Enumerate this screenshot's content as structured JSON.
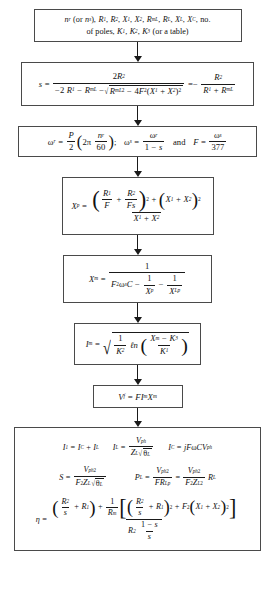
{
  "diagram": {
    "type": "flowchart",
    "orientation": "top-to-bottom",
    "node_count": 8,
    "connector": "down-arrow",
    "border_color": "#4a4a4a",
    "background_color": "#ffffff",
    "text_color": "#111111"
  },
  "nodes": [
    {
      "id": "inputs",
      "name": "input-parameters",
      "line1": "n_r (or n_s), R_1, R_2, X_1, X_2, R_mL, R_L, X_L, X_C, no.",
      "line2": "of poles, K_1, K_2, K_3 (or a table)",
      "symbols": {
        "n": "n",
        "nr_sub": "r",
        "or": "(or",
        "ns_sub": "s",
        "close": "),",
        "R": "R",
        "X": "X",
        "K": "K",
        "s1": "1",
        "s2": "2",
        "smL": "mL",
        "sL": "L",
        "sC": "C",
        "s3": "3",
        "no": "no.",
        "poles": "of poles,",
        "table": "(or a table)"
      }
    },
    {
      "id": "slip",
      "name": "slip-equation",
      "lhs": "s",
      "eq": "=",
      "numerator": "2R_2",
      "denominator": "-2R_1 - R_mL - sqrt(R_mL^2 - 4F^2(X_1+X_2)^2)",
      "rhs_sign": "= -",
      "rhs_numerator": "R_2",
      "rhs_denominator": "R_1 + R_mL"
    },
    {
      "id": "omega",
      "name": "angular-velocity-equations",
      "expr1": "omega_r = (P/2)(2 pi n_r/60)",
      "separator": ";",
      "expr2": "omega_s = omega_r / (1 - s)",
      "conjunction": "and",
      "expr3": "F = omega_s / 377",
      "values": {
        "two": "2",
        "sixty": "60",
        "twopi": "2π",
        "one": "1",
        "threeseventyseven": "377"
      }
    },
    {
      "id": "xp",
      "name": "xp-equation",
      "lhs": "X_p",
      "numerator": "(R_1/F + R_2/Fs)^2 + (X_1 + X_2)^2",
      "denominator": "X_1 + X_2"
    },
    {
      "id": "xm",
      "name": "xm-equation",
      "lhs": "X_m",
      "numerator": "1",
      "denominator": "F^2 omega_s C - 1/X_p - 1/X_Lp"
    },
    {
      "id": "im",
      "name": "im-equation",
      "lhs": "I_m",
      "expr": "sqrt( (1/K_2) ln( (X_m - K_3)/K_1 ) )",
      "ln": "ℓn"
    },
    {
      "id": "vf",
      "name": "vf-equation",
      "expr": "V_f = F I_m X_m"
    },
    {
      "id": "final",
      "name": "output-equations",
      "row1": [
        {
          "name": "i1-equation",
          "expr": "I_1 = I_C + I_L"
        },
        {
          "name": "il-equation",
          "expr": "I_L = V_ph / (Z_L sqrt(theta_L))"
        },
        {
          "name": "ic-equation",
          "expr": "I_C = j F omega C V_ph"
        }
      ],
      "row2": [
        {
          "name": "s-apparent-power-equation",
          "expr": "S = V_ph^2 / (F^2 Z_L sqrt(theta_L))"
        },
        {
          "name": "pl-load-power-equation",
          "expr": "P_L = V_ph^2/(F R_Lp) = V_ph^2/(F^2 Z_L^2) R_L"
        }
      ],
      "row3": {
        "name": "efficiency-equation",
        "lhs": "eta",
        "numerator": "(R_2/s + R_1) + (1/R_m)[(R_2/s + R_1)^2 + F^2(X_1 + X_2)^2]",
        "denominator": "R_2 (1 - s)/s"
      }
    }
  ],
  "glyphs": {
    "omega": "ω",
    "pi": "π",
    "eta": "η",
    "theta": "θ",
    "ell_n": "ℓn",
    "minus": "−",
    "plus": "+",
    "equals": "=",
    "sqrt": "√",
    "j": "j"
  },
  "arrows": {
    "count": 7,
    "direction": "down",
    "name": "flow-arrow"
  }
}
